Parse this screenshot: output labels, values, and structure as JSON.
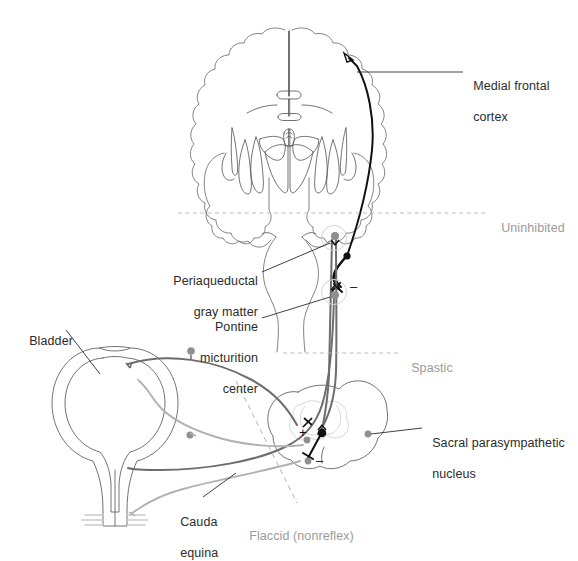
{
  "figure": {
    "background": "#ffffff",
    "colors": {
      "outline": "#4a4a4a",
      "brain_outline": "#6e6e6e",
      "dark_tract": "#111111",
      "mid_gray_tract": "#6d6d6d",
      "light_gray_tract": "#b1b1b1",
      "dashed_level": "#b9b9b9",
      "label_text": "#2b2b2b",
      "label_text_gray": "#9a9a9a",
      "node_dark": "#111111",
      "node_gray": "#8f8f8f"
    }
  },
  "labels": {
    "medial_frontal_cortex": {
      "line1": "Medial frontal",
      "line2": "cortex"
    },
    "periaqueductal_gray": {
      "line1": "Periaqueductal",
      "line2": "gray matter"
    },
    "pontine_micturition_center": {
      "line1": "Pontine",
      "line2": "micturition",
      "line3": "center"
    },
    "bladder": {
      "line1": "Bladder"
    },
    "cauda_equina": {
      "line1": "Cauda",
      "line2": "equina"
    },
    "sacral_parasympathetic_nucleus": {
      "line1": "Sacral parasympathetic",
      "line2": "nucleus"
    }
  },
  "lesion_levels": [
    {
      "id": "uninhibited",
      "text": "Uninhibited",
      "y": 213
    },
    {
      "id": "spastic",
      "text": "Spastic",
      "y": 353
    },
    {
      "id": "flaccid",
      "text": "Flaccid (nonreflex)",
      "y": 521
    }
  ],
  "synapse_symbols": [
    {
      "id": "pmc-inhibitory",
      "symbol": "–",
      "x": 352,
      "y": 286
    },
    {
      "id": "cord-excitatory",
      "symbol": "+",
      "x": 304,
      "y": 433
    },
    {
      "id": "cord-inhibitory",
      "symbol": "–",
      "x": 320,
      "y": 461
    }
  ],
  "structures": [
    {
      "id": "cerebrum",
      "name": "cerebral hemispheres (coronal section)"
    },
    {
      "id": "lateral-ventricles",
      "name": "lateral ventricles"
    },
    {
      "id": "basal-ganglia",
      "name": "basal ganglia"
    },
    {
      "id": "temporal-lobes",
      "name": "temporal lobes"
    },
    {
      "id": "brainstem",
      "name": "brainstem / pons"
    },
    {
      "id": "sacral-cord",
      "name": "sacral spinal cord cross-section"
    },
    {
      "id": "bladder-body",
      "name": "urinary bladder"
    },
    {
      "id": "urethra",
      "name": "urethra / external sphincter"
    }
  ],
  "pathways": [
    {
      "id": "cortico-pontine-tract",
      "name": "medial frontal cortex to pontine micturition center",
      "color": "#111111"
    },
    {
      "id": "pag-to-cortex",
      "name": "periaqueductal gray ascending to cortex",
      "color": "#111111"
    },
    {
      "id": "pmc-descending",
      "name": "pontine micturition center descending to sacral cord",
      "color": "#6d6d6d"
    },
    {
      "id": "ascending-afferent",
      "name": "bladder afferent ascending to PAG",
      "color": "#6d6d6d"
    },
    {
      "id": "bladder-efferent",
      "name": "parasympathetic efferent to bladder",
      "color": "#b1b1b1"
    },
    {
      "id": "pudendal-nerve",
      "name": "pudendal nerve to external sphincter",
      "color": "#b1b1b1"
    }
  ]
}
